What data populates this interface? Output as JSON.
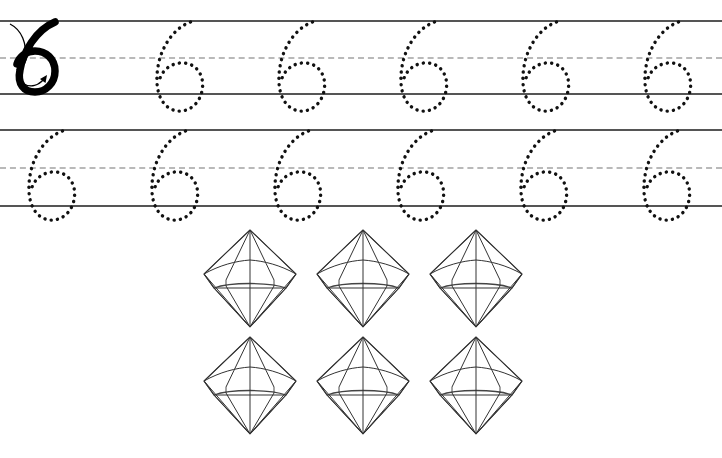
{
  "worksheet": {
    "title": "Number 6 Tracing Worksheet",
    "target_numeral": "6",
    "canvas": {
      "width": 722,
      "height": 458,
      "background": "#ffffff"
    },
    "colors": {
      "rule_solid": "#555555",
      "rule_dashed": "#b9b9b9",
      "model_numeral": "#000000",
      "trace_dots": "#111111",
      "gem_stroke": "#333333",
      "arrow": "#000000"
    },
    "practice_rows": [
      {
        "name": "row-1",
        "top_line_y": 20,
        "mid_line_y": 57,
        "bottom_line_y": 93,
        "model": {
          "label": "6",
          "x": 14,
          "stroke_arrows": [
            {
              "name": "down-stroke-arrow",
              "direction": "down"
            },
            {
              "name": "loop-arrow",
              "direction": "clockwise-into-loop"
            }
          ]
        },
        "trace_glyphs": [
          {
            "label": "6",
            "x": 150
          },
          {
            "label": "6",
            "x": 272
          },
          {
            "label": "6",
            "x": 394
          },
          {
            "label": "6",
            "x": 516
          },
          {
            "label": "6",
            "x": 638
          }
        ]
      },
      {
        "name": "row-2",
        "top_line_y": 129,
        "mid_line_y": 167,
        "bottom_line_y": 205,
        "model": null,
        "trace_glyphs": [
          {
            "label": "6",
            "x": 22
          },
          {
            "label": "6",
            "x": 145
          },
          {
            "label": "6",
            "x": 268
          },
          {
            "label": "6",
            "x": 391
          },
          {
            "label": "6",
            "x": 514
          },
          {
            "label": "6",
            "x": 637
          }
        ]
      }
    ],
    "counting_section": {
      "name": "gem-count-group",
      "item_name": "diamond-gem",
      "count": 6,
      "rows": 2,
      "columns": 3,
      "items": [
        {
          "index": 1,
          "x": 200,
          "y": 228
        },
        {
          "index": 2,
          "x": 313,
          "y": 228
        },
        {
          "index": 3,
          "x": 426,
          "y": 228
        },
        {
          "index": 4,
          "x": 200,
          "y": 335
        },
        {
          "index": 5,
          "x": 313,
          "y": 335
        },
        {
          "index": 6,
          "x": 426,
          "y": 335
        }
      ]
    }
  }
}
